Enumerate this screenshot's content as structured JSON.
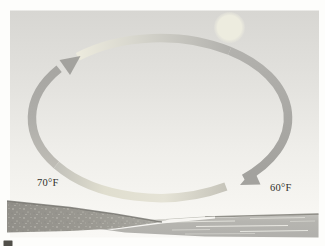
{
  "figure": {
    "labels": {
      "left_temperature": "70°F",
      "right_temperature": "60°F"
    },
    "colors": {
      "sky_top": "#d7d6d2",
      "sky_bottom": "#f7f6f2",
      "sun": "#edecdf",
      "loop_gray": "#aeada9",
      "loop_pale": "#eceadd",
      "arrowhead": "#a3a29e",
      "land": "#9b9992",
      "land_edge": "#6f6e68",
      "water": "#b6b5b0",
      "water_edge": "#807f78",
      "label_text": "#2f2e2a",
      "caption_fragment": "#514f49"
    },
    "icons": {
      "sun": "sun-icon",
      "updraft_arrow": "arrow-up-right-icon",
      "downdraft_arrow": "arrow-down-left-icon"
    }
  }
}
